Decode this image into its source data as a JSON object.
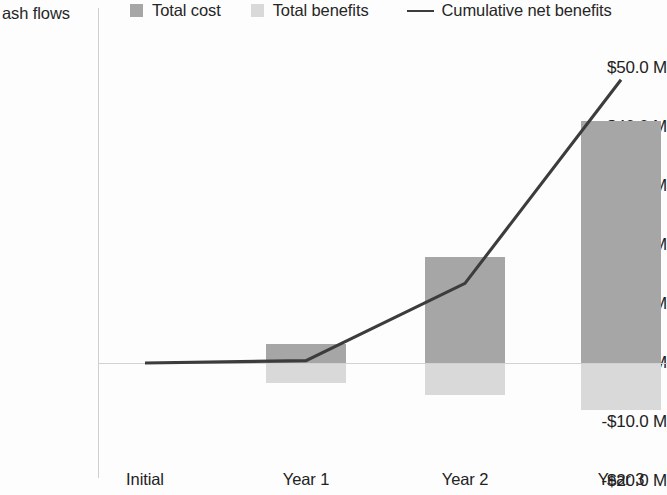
{
  "legend": {
    "axis_title": "ash flows",
    "items": [
      {
        "label": "Total cost",
        "marker": "square-swatch-icon",
        "color": "#a6a6a6"
      },
      {
        "label": "Total benefits",
        "marker": "square-swatch-icon",
        "color": "#d9d9d9"
      },
      {
        "label": "Cumulative net benefits",
        "marker": "line-swatch-icon",
        "color": "#3c3c3c"
      }
    ]
  },
  "chart_data": {
    "type": "bar",
    "title": "",
    "subtitle": "",
    "xlabel": "",
    "ylabel": "ash flows",
    "categories": [
      "Initial",
      "Year 1",
      "Year 2",
      "Year 3"
    ],
    "ylim": [
      -20.0,
      55.0
    ],
    "ytick_values": [
      50.0,
      40.0,
      30.0,
      20.0,
      10.0,
      0.0,
      -10.0,
      -20.0
    ],
    "ytick_labels": [
      "$50.0 M",
      "$40.0 M",
      "$30.0 M",
      "$20.0 M",
      "$10.0 M",
      "$0 M",
      "-$10.0 M",
      "-$20.0 M"
    ],
    "grid": false,
    "legend_position": "top",
    "units": "millions of dollars",
    "series": [
      {
        "name": "Total cost",
        "type": "bar",
        "color": "#a6a6a6",
        "values": [
          0.0,
          3.2,
          18.0,
          41.0
        ]
      },
      {
        "name": "Total benefits",
        "type": "bar",
        "color": "#d9d9d9",
        "values": [
          0.0,
          -3.4,
          -5.4,
          -8.0
        ]
      },
      {
        "name": "Cumulative net benefits",
        "type": "line",
        "color": "#3c3c3c",
        "values": [
          0.0,
          0.4,
          13.5,
          48.0
        ]
      }
    ]
  }
}
